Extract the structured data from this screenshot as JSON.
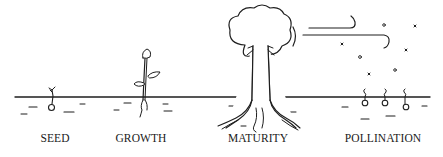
{
  "diagram": {
    "colors": {
      "ink": "#1e1e1e",
      "background": "#ffffff"
    },
    "stages": [
      {
        "id": "seed",
        "label": "SEED",
        "x": 55
      },
      {
        "id": "growth",
        "label": "GROWTH",
        "x": 141
      },
      {
        "id": "maturity",
        "label": "MATURITY",
        "x": 258
      },
      {
        "id": "pollination",
        "label": "POLLINATION",
        "x": 383
      }
    ],
    "icons": [
      "ground-line-icon",
      "seed-sprout-icon",
      "young-plant-icon",
      "tree-icon",
      "wind-icon",
      "pollen-particles-icon",
      "sprouting-seeds-icon"
    ]
  }
}
